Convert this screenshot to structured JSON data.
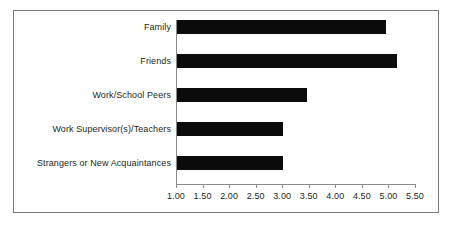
{
  "chart_data": {
    "type": "bar",
    "orientation": "horizontal",
    "title": "",
    "subtitle": "",
    "xlabel": "",
    "ylabel": "",
    "categories": [
      "Family",
      "Friends",
      "Work/School Peers",
      "Work Supervisor(s)/Teachers",
      "Strangers or New Acquaintances"
    ],
    "values": [
      4.95,
      5.16,
      3.47,
      3.02,
      3.02
    ],
    "series": [
      {
        "name": "",
        "values": [
          4.95,
          5.16,
          3.47,
          3.02,
          3.02
        ]
      }
    ],
    "xlim": [
      1.0,
      5.5
    ],
    "xticks": [
      1.0,
      1.5,
      2.0,
      2.5,
      3.0,
      3.5,
      4.0,
      4.5,
      5.0,
      5.5
    ],
    "xtick_labels": [
      "1.00",
      "1.50",
      "2.00",
      "2.50",
      "3.00",
      "3.50",
      "4.00",
      "4.50",
      "5.00",
      "5.50"
    ],
    "grid": false,
    "legend": false,
    "legend_position": "none",
    "bar_color": "#0b0b0b",
    "axis_color": "#8a8a8e",
    "text_color": "#231f20",
    "frame_color": "#7b7b7f",
    "background_color": "#ffffff",
    "annotations": []
  }
}
